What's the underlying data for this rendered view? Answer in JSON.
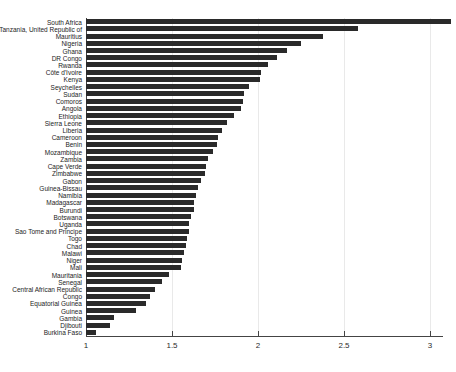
{
  "chart_data": {
    "type": "bar",
    "orientation": "horizontal",
    "title": "",
    "subtitle": "",
    "xlabel": "",
    "ylabel": "",
    "xlim": [
      1,
      3.2
    ],
    "ylim": null,
    "grid": false,
    "legend": null,
    "legend_position": "none",
    "bar_color": "#2a2a2a",
    "axis_color": "#444444",
    "xticks": [
      1,
      1.5,
      2,
      2.5,
      3
    ],
    "xticklabels": [
      "1",
      "1.5",
      "2",
      "2.5",
      "3"
    ],
    "categories": [
      "South Africa",
      "Tanzania, United Republic of",
      "Mauritius",
      "Nigeria",
      "Ghana",
      "DR Congo",
      "Rwanda",
      "Côte d'Ivoire",
      "Kenya",
      "Seychelles",
      "Sudan",
      "Comoros",
      "Angola",
      "Ethiopia",
      "Sierra Leone",
      "Liberia",
      "Cameroon",
      "Benin",
      "Mozambique",
      "Zambia",
      "Cape Verde",
      "Zimbabwe",
      "Gabon",
      "Guinea-Bissau",
      "Namibia",
      "Madagascar",
      "Burundi",
      "Botswana",
      "Uganda",
      "Sao Tome and Principe",
      "Togo",
      "Chad",
      "Malawi",
      "Niger",
      "Mali",
      "Mauritania",
      "Senegal",
      "Central African Republic",
      "Congo",
      "Equatorial Guinea",
      "Guinea",
      "Gambia",
      "Djibouti",
      "Burkina Faso"
    ],
    "values": [
      3.12,
      2.58,
      2.38,
      2.25,
      2.17,
      2.11,
      2.06,
      2.02,
      2.01,
      1.95,
      1.92,
      1.91,
      1.9,
      1.86,
      1.82,
      1.79,
      1.77,
      1.76,
      1.74,
      1.71,
      1.7,
      1.69,
      1.67,
      1.65,
      1.64,
      1.63,
      1.63,
      1.61,
      1.6,
      1.6,
      1.59,
      1.58,
      1.57,
      1.56,
      1.55,
      1.48,
      1.44,
      1.4,
      1.37,
      1.35,
      1.29,
      1.16,
      1.14,
      1.06
    ]
  }
}
